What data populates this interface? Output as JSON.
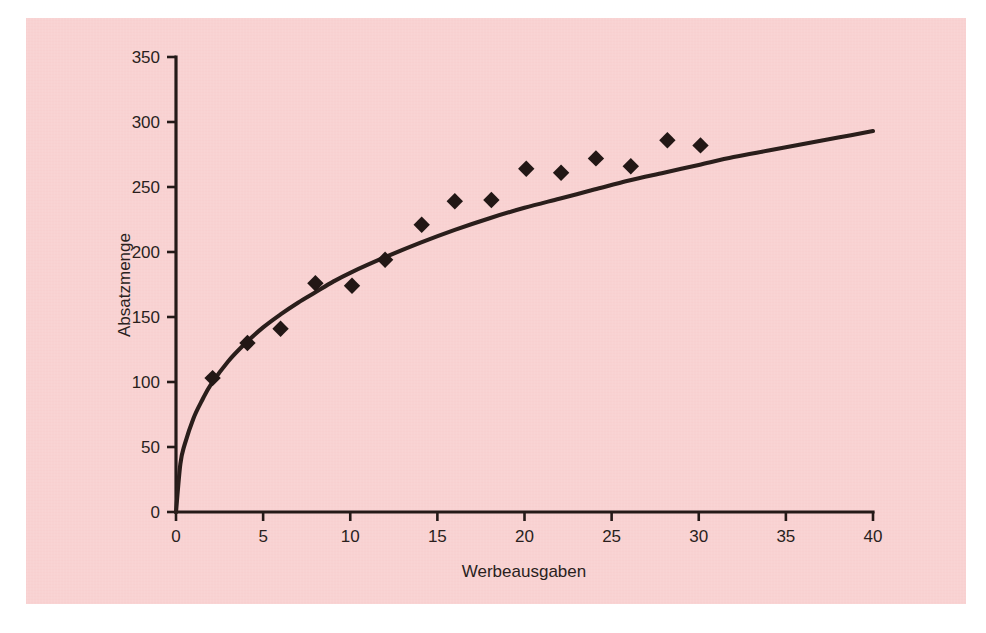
{
  "figure": {
    "background_color": "#f9d2d2",
    "ink_color": "#241a18",
    "page_color": "#ffffff"
  },
  "chart_data": {
    "type": "scatter",
    "title": "",
    "subtitle": "",
    "xlabel": "Werbeausgaben",
    "ylabel": "Absatzmenge",
    "xlim": [
      0,
      40
    ],
    "ylim": [
      0,
      350
    ],
    "xticks": [
      0,
      5,
      10,
      15,
      20,
      25,
      30,
      35,
      40
    ],
    "yticks": [
      0,
      50,
      100,
      150,
      200,
      250,
      300,
      350
    ],
    "xtick_labels": [
      "0",
      "5",
      "10",
      "15",
      "20",
      "25",
      "30",
      "35",
      "40"
    ],
    "ytick_labels": [
      "0",
      "50",
      "100",
      "150",
      "200",
      "250",
      "300",
      "350"
    ],
    "grid": false,
    "legend": false,
    "legend_position": "none",
    "series": [
      {
        "name": "Beobachtungen",
        "type": "scatter",
        "marker": "diamond",
        "color": "#221715",
        "x": [
          2.1,
          4.1,
          6.0,
          8.0,
          10.1,
          12.0,
          14.1,
          16.0,
          18.1,
          20.1,
          22.1,
          24.1,
          26.1,
          28.2,
          30.1
        ],
        "y": [
          103,
          130,
          141,
          176,
          174,
          194,
          221,
          239,
          240,
          264,
          261,
          272,
          266,
          286,
          282
        ]
      },
      {
        "name": "Anpassungskurve",
        "type": "line",
        "color": "#2a1e1b",
        "x": [
          0,
          0.25,
          0.5,
          1,
          1.5,
          2,
          3,
          4,
          5,
          6,
          7,
          8,
          9,
          10,
          12,
          14,
          16,
          18,
          20,
          22,
          24,
          26,
          28,
          30,
          32,
          34,
          36,
          38,
          40
        ],
        "y": [
          0,
          37,
          52,
          72,
          86,
          98,
          116,
          130,
          142,
          152,
          161,
          169,
          177,
          184,
          196,
          207,
          217,
          226,
          234,
          241,
          248,
          255,
          261,
          267,
          273,
          278,
          283,
          288,
          293
        ]
      }
    ]
  }
}
